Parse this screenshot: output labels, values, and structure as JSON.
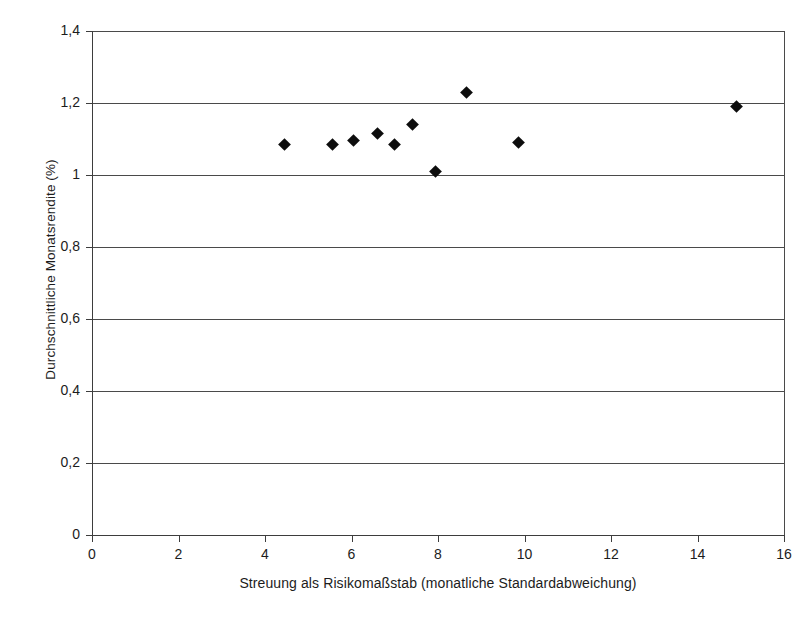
{
  "chart_data": {
    "type": "scatter",
    "title": "",
    "subtitle": "",
    "xlabel": "Streuung als Risikomaßstab (monatliche Standardabweichung)",
    "ylabel": "Durchschnittliche Monatsrendite (%)",
    "xlim": [
      0,
      16
    ],
    "ylim": [
      0,
      1.4
    ],
    "xticks": [
      0,
      2,
      4,
      6,
      8,
      10,
      12,
      14,
      16
    ],
    "xtick_labels": [
      "0",
      "2",
      "4",
      "6",
      "8",
      "10",
      "12",
      "14",
      "16"
    ],
    "yticks": [
      0,
      0.2,
      0.4,
      0.6,
      0.8,
      1.0,
      1.2,
      1.4
    ],
    "ytick_labels": [
      "0",
      "0,2",
      "0,4",
      "0,6",
      "0,8",
      "1",
      "1,2",
      "1,4"
    ],
    "grid": "horizontal",
    "legend": "none",
    "marker": "diamond",
    "marker_color": "#0d0d0d",
    "points": [
      {
        "x": 4.45,
        "y": 1.085
      },
      {
        "x": 5.55,
        "y": 1.085
      },
      {
        "x": 6.05,
        "y": 1.095
      },
      {
        "x": 6.6,
        "y": 1.115
      },
      {
        "x": 7.0,
        "y": 1.085
      },
      {
        "x": 7.4,
        "y": 1.14
      },
      {
        "x": 7.95,
        "y": 1.01
      },
      {
        "x": 8.65,
        "y": 1.23
      },
      {
        "x": 9.85,
        "y": 1.09
      },
      {
        "x": 14.9,
        "y": 1.19
      }
    ]
  },
  "axes": {
    "x_title": "Streuung als Risikomaßstab (monatliche Standardabweichung)",
    "y_title": "Durchschnittliche Monatsrendite (%)"
  }
}
